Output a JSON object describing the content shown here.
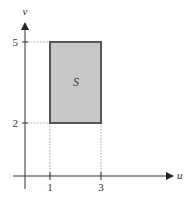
{
  "diagram": {
    "title": "",
    "axes": {
      "x_label": "u",
      "y_label": "v",
      "x_ticks": [
        {
          "value": 1,
          "label": "1"
        },
        {
          "value": 3,
          "label": "3"
        }
      ],
      "y_ticks": [
        {
          "value": 2,
          "label": "2"
        },
        {
          "value": 5,
          "label": "5"
        }
      ]
    },
    "region": {
      "label": "S",
      "u_range": [
        1,
        3
      ],
      "v_range": [
        2,
        5
      ],
      "fill_color": "#c8c8c8",
      "stroke_color": "#555555"
    },
    "colors": {
      "axis": "#333333",
      "guide": "#aaaaaa"
    }
  }
}
